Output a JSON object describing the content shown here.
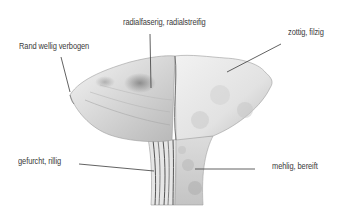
{
  "diagram": {
    "labels": [
      {
        "id": "rand",
        "text": "Rand wellig verbogen"
      },
      {
        "id": "radial",
        "text": "radialfaserig, radialstreifig"
      },
      {
        "id": "zottig",
        "text": "zottig, filzig"
      },
      {
        "id": "gefurcht",
        "text": "gefurcht, rillig"
      },
      {
        "id": "mehlig",
        "text": "mehlig, bereift"
      }
    ],
    "colors": {
      "background": "#ffffff",
      "text": "#3a3a3a",
      "leader_line": "#3a3a3a",
      "drawing_light": "#ececec",
      "drawing_shade": "#8a8a8a"
    }
  }
}
